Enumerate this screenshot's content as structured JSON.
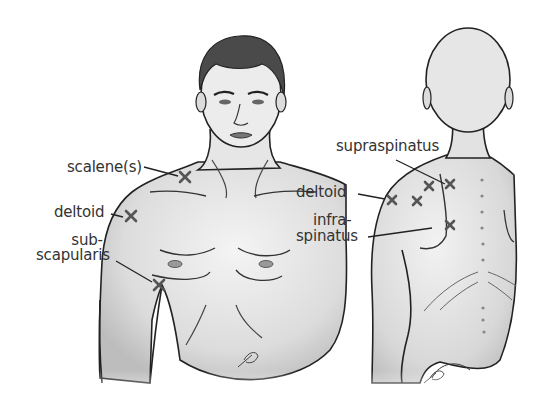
{
  "figure": {
    "views": [
      {
        "id": "anterior",
        "label": "Front view"
      },
      {
        "id": "posterior",
        "label": "Back view"
      }
    ]
  },
  "labels": {
    "front": {
      "scalenes": "scalene(s)",
      "deltoid": "deltoid",
      "subscapularis_line1": "sub-",
      "subscapularis_line2": "scapularis"
    },
    "back": {
      "supraspinatus": "supraspinatus",
      "deltoid": "deltoid",
      "infraspinatus_line1": "infra-",
      "infraspinatus_line2": "spinatus"
    }
  },
  "markers": {
    "glyph": "X",
    "color": "#555555",
    "front": [
      {
        "muscle": "scalenes",
        "x": 185,
        "y": 177
      },
      {
        "muscle": "deltoid",
        "x": 131,
        "y": 216
      },
      {
        "muscle": "subscapularis",
        "x": 159,
        "y": 285
      }
    ],
    "back": [
      {
        "muscle": "supraspinatus",
        "x": 429,
        "y": 186
      },
      {
        "muscle": "supraspinatus",
        "x": 450,
        "y": 184
      },
      {
        "muscle": "deltoid",
        "x": 392,
        "y": 200
      },
      {
        "muscle": "supraspinatus",
        "x": 417,
        "y": 201
      },
      {
        "muscle": "infraspinatus",
        "x": 450,
        "y": 225
      }
    ]
  },
  "signature": "artist signature"
}
